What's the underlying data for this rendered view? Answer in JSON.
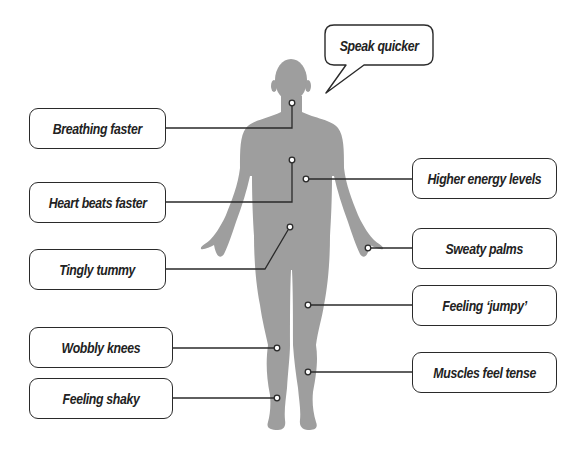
{
  "diagram": {
    "type": "body-symptoms",
    "colors": {
      "silhouette": "#9e9e9e",
      "stroke": "#2a2a2a",
      "background": "#ffffff"
    },
    "speech_bubble": {
      "label": "Speak quicker"
    },
    "labels": [
      {
        "id": "breathing",
        "text": "Breathing faster",
        "side": "left"
      },
      {
        "id": "heart",
        "text": "Heart beats faster",
        "side": "left"
      },
      {
        "id": "tummy",
        "text": "Tingly tummy",
        "side": "left"
      },
      {
        "id": "knees",
        "text": "Wobbly knees",
        "side": "left"
      },
      {
        "id": "shaky",
        "text": "Feeling shaky",
        "side": "left"
      },
      {
        "id": "energy",
        "text": "Higher energy levels",
        "side": "right"
      },
      {
        "id": "palms",
        "text": "Sweaty palms",
        "side": "right"
      },
      {
        "id": "jumpy",
        "text": "Feeling ‘jumpy’",
        "side": "right"
      },
      {
        "id": "muscles",
        "text": "Muscles feel tense",
        "side": "right"
      }
    ]
  }
}
